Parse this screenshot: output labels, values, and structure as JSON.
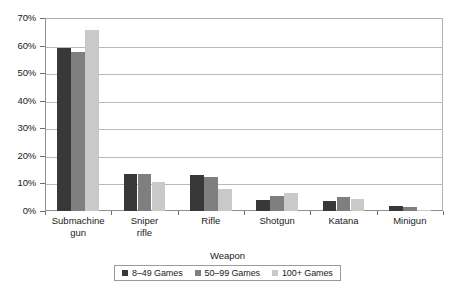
{
  "chart_data": {
    "type": "bar",
    "title": "",
    "xlabel": "Weapon",
    "ylabel": "",
    "categories": [
      "Submachine\ngun",
      "Sniper\nrifle",
      "Rifle",
      "Shotgun",
      "Katana",
      "Minigun"
    ],
    "ylim": [
      0,
      70
    ],
    "ytick_labels": [
      "0%",
      "10%",
      "20%",
      "30%",
      "40%",
      "50%",
      "60%",
      "70%"
    ],
    "ytick_values": [
      0,
      10,
      20,
      30,
      40,
      50,
      60,
      70
    ],
    "grid": "horizontal",
    "legend_position": "bottom-center",
    "series": [
      {
        "name": "8–49 Games",
        "color": "#383838",
        "values": [
          59.0,
          13.5,
          13.0,
          4.0,
          3.5,
          2.0
        ]
      },
      {
        "name": "50–99 Games",
        "color": "#7f7f7f",
        "values": [
          57.5,
          13.5,
          12.5,
          5.5,
          5.0,
          1.5
        ]
      },
      {
        "name": "100+ Games",
        "color": "#c9c9c9",
        "values": [
          65.5,
          10.5,
          8.0,
          6.5,
          4.5,
          0.5
        ]
      }
    ]
  },
  "axis": {
    "x_title": "Weapon"
  }
}
